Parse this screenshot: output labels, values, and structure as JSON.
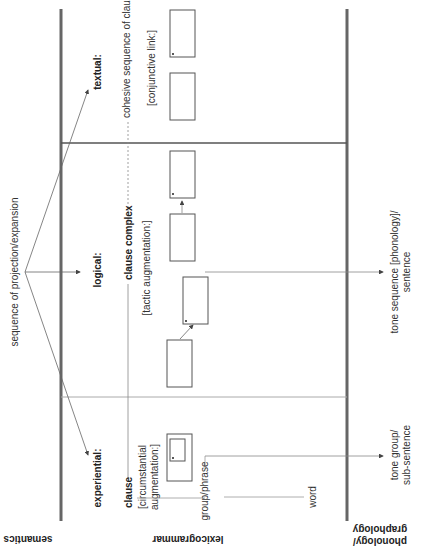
{
  "diagram": {
    "strata": {
      "semantics": "semantics",
      "lexicogrammar": "lexicogrammar",
      "phonology_line1": "phonology/",
      "phonology_line2": "graphology"
    },
    "semantics": {
      "sequence_label": "sequence of projection/expansion"
    },
    "metafunctions": {
      "textual": "textual:",
      "logical": "logical:",
      "experiential": "experiential:"
    },
    "textual": {
      "unit": "cohesive sequence of clauses",
      "note": "[conjunctive link:]"
    },
    "logical": {
      "unit": "clause complex",
      "note": "[tactic augmentation:]"
    },
    "experiential": {
      "unit": "clause",
      "note_line1": "[circumstantial",
      "note_line2": "augmentation:]"
    },
    "rank": {
      "group": "group/phrase",
      "word": "word"
    },
    "phonology": {
      "tone_sequence_line1": "tone sequence [phonology]/",
      "tone_sequence_line2": "sentence",
      "tone_group_line1": "tone group/",
      "tone_group_line2": "sub-sentence"
    },
    "colors": {
      "thick_line": "#666666",
      "thin_line": "#888888",
      "divider_dark": "#555555",
      "divider_light": "#aaaaaa",
      "text": "#333333"
    }
  }
}
